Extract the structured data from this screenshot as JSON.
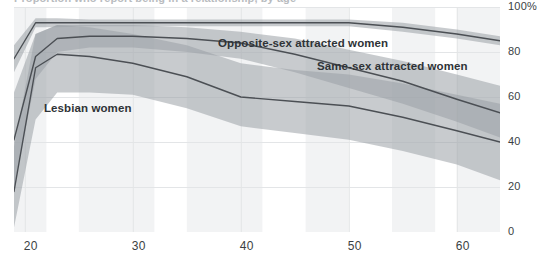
{
  "title_strip": {
    "cropped_title": "Proportion who report being in a relationship, by age"
  },
  "axes": {
    "y_ticks": [
      {
        "label": "100%",
        "value": 100
      },
      {
        "label": "80",
        "value": 80
      },
      {
        "label": "60",
        "value": 60
      },
      {
        "label": "40",
        "value": 40
      },
      {
        "label": "20",
        "value": 20
      },
      {
        "label": "0",
        "value": 0
      }
    ],
    "x_ticks": [
      {
        "label": "20",
        "value": 20
      },
      {
        "label": "30",
        "value": 30
      },
      {
        "label": "40",
        "value": 40
      },
      {
        "label": "50",
        "value": 50
      },
      {
        "label": "60",
        "value": 60
      }
    ]
  },
  "annotations": [
    {
      "name": "opposite-sex-attracted-women-label",
      "text": "Opposite-sex attracted women",
      "x": 218,
      "y": 37
    },
    {
      "name": "same-sex-attracted-women-label",
      "text": "Same-sex attracted women",
      "x": 317,
      "y": 60
    },
    {
      "name": "lesbian-women-label",
      "text": "Lesbian women",
      "x": 44,
      "y": 102
    }
  ],
  "colors": {
    "line": "#4b4f54",
    "band": "#9aa0a6",
    "band_opacity": 0.55,
    "background_stripe": "#f2f3f4",
    "gridline": "#e3e5e7",
    "tick_text": "#3b3f43",
    "annotation_text": "#2f3337"
  },
  "chart_data": {
    "type": "line",
    "title": "Proportion who report being in a relationship, by age",
    "xlabel": "",
    "ylabel": "",
    "xlim": [
      19,
      64
    ],
    "ylim": [
      0,
      100
    ],
    "grid": true,
    "legend_position": "inline-annotations",
    "y_tick_labels": [
      "0",
      "20",
      "40",
      "60",
      "80",
      "100%"
    ],
    "x_tick_labels": [
      "20",
      "30",
      "40",
      "50",
      "60"
    ],
    "background_stripes": [
      {
        "x0": 19,
        "x1": 22
      },
      {
        "x0": 25,
        "x1": 32
      },
      {
        "x0": 35,
        "x1": 42
      },
      {
        "x0": 46,
        "x1": 50
      },
      {
        "x0": 54,
        "x1": 58
      },
      {
        "x0": 60,
        "x1": 64
      }
    ],
    "series": [
      {
        "name": "Opposite-sex attracted women",
        "x": [
          19,
          21,
          23,
          26,
          30,
          35,
          40,
          45,
          50,
          55,
          60,
          64
        ],
        "values": [
          77,
          93,
          93,
          93,
          93,
          93,
          93,
          93,
          93,
          91,
          88,
          85
        ],
        "band_lower": [
          71,
          91,
          91,
          91.5,
          91.5,
          91.5,
          91.5,
          91.5,
          91.5,
          89,
          86,
          83
        ],
        "band_upper": [
          83,
          95,
          95,
          94.5,
          94.5,
          94.5,
          94.5,
          94.5,
          94.5,
          93,
          90,
          87
        ]
      },
      {
        "name": "Same-sex attracted women",
        "x": [
          19,
          21,
          23,
          26,
          30,
          35,
          40,
          45,
          50,
          55,
          60,
          64
        ],
        "values": [
          41,
          78,
          86,
          87,
          87,
          86,
          84,
          79,
          73,
          67,
          59,
          53
        ],
        "band_lower": [
          20,
          68,
          80,
          82,
          82,
          80,
          77,
          71,
          64,
          57,
          49,
          42
        ],
        "band_upper": [
          62,
          88,
          92,
          92,
          92,
          91,
          89,
          86,
          81,
          76,
          70,
          65
        ]
      },
      {
        "name": "Lesbian women",
        "x": [
          19,
          21,
          23,
          26,
          30,
          35,
          40,
          45,
          50,
          55,
          60,
          64
        ],
        "values": [
          18,
          73,
          79,
          78,
          75,
          69,
          60,
          58,
          56,
          51,
          45,
          40
        ],
        "band_lower": [
          2,
          50,
          62,
          62,
          61,
          55,
          47,
          44,
          41,
          36,
          30,
          23
        ],
        "band_upper": [
          38,
          88,
          92,
          91,
          88,
          83,
          75,
          72,
          70,
          66,
          61,
          57
        ]
      }
    ]
  }
}
